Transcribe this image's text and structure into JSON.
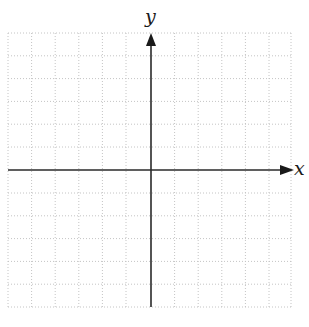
{
  "diagram": {
    "type": "coordinate-plane",
    "axes": {
      "x_label": "x",
      "y_label": "y"
    },
    "grid": {
      "columns": 12,
      "rows": 12,
      "style": "dotted",
      "color": "#bdbdbd"
    },
    "axis_color": "#2a2a2a"
  }
}
